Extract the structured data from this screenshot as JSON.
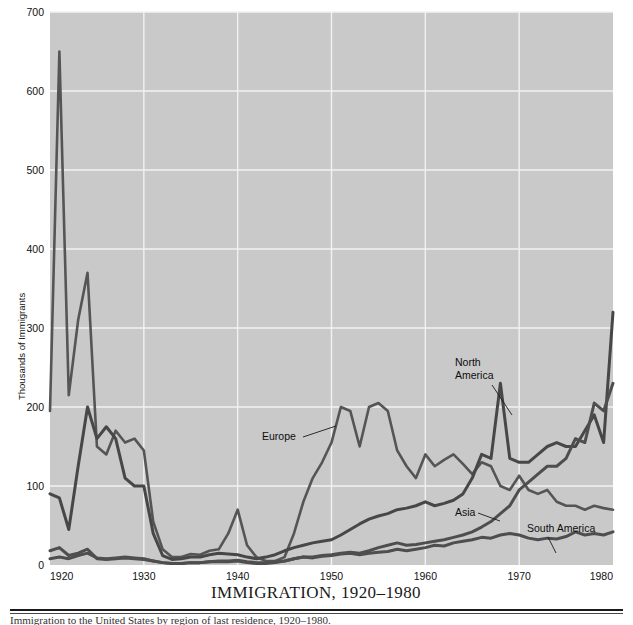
{
  "figure": {
    "caption": "IMMIGRATION, 1920–1980",
    "footnote": "Immigration to the United States by region of last residence, 1920–1980.",
    "width": 633,
    "height": 625
  },
  "plot": {
    "background_color": "#c9c9c9",
    "gridline_color": "#f2f2f2",
    "left": 50,
    "top": 12,
    "right": 613,
    "bottom": 565
  },
  "axes": {
    "y_title": "Thousands of Immigrants",
    "y_ticks": [
      0,
      100,
      200,
      300,
      400,
      500,
      600,
      700
    ],
    "y_tick_labels": [
      "0",
      "100",
      "200",
      "300",
      "400",
      "500",
      "600",
      "700"
    ],
    "y_min": 0,
    "y_max": 700,
    "x_ticks": [
      1920,
      1930,
      1940,
      1950,
      1960,
      1970,
      1980
    ],
    "x_tick_labels": [
      "1920",
      "1930",
      "1940",
      "1950",
      "1960",
      "1970",
      "1980"
    ],
    "x_min": 1920,
    "x_max": 1980
  },
  "annotations": [
    {
      "name": "europe",
      "text": "Europe",
      "text_x": 262,
      "text_y": 440,
      "anchor": "start",
      "leader": "M 303 437 L 336 426"
    },
    {
      "name": "north-america",
      "text_lines": [
        "North",
        "America"
      ],
      "text_x": 455,
      "text_y": 366,
      "anchor": "start",
      "leader": "M 492 385 L 512 415"
    },
    {
      "name": "asia",
      "text": "Asia",
      "text_x": 455,
      "text_y": 516,
      "anchor": "start",
      "leader": "M 478 513 L 500 521"
    },
    {
      "name": "south-america",
      "text": "South America",
      "text_x": 527,
      "text_y": 532,
      "anchor": "start",
      "leader": "M 548 537 L 556 553"
    }
  ],
  "chart_data": {
    "type": "line",
    "title": "IMMIGRATION, 1920–1980",
    "xlabel": "",
    "ylabel": "Thousands of Immigrants",
    "xlim": [
      1920,
      1980
    ],
    "ylim": [
      0,
      700
    ],
    "grid": true,
    "legend_position": "inline-annotations",
    "line_color": "#4a4a4a",
    "x": [
      1920,
      1921,
      1922,
      1923,
      1924,
      1925,
      1926,
      1927,
      1928,
      1929,
      1930,
      1931,
      1932,
      1933,
      1934,
      1935,
      1936,
      1937,
      1938,
      1939,
      1940,
      1941,
      1942,
      1943,
      1944,
      1945,
      1946,
      1947,
      1948,
      1949,
      1950,
      1951,
      1952,
      1953,
      1954,
      1955,
      1956,
      1957,
      1958,
      1959,
      1960,
      1961,
      1962,
      1963,
      1964,
      1965,
      1966,
      1967,
      1968,
      1969,
      1970,
      1971,
      1972,
      1973,
      1974,
      1975,
      1976,
      1977,
      1978,
      1979,
      1980
    ],
    "series": [
      {
        "name": "Europe",
        "values": [
          195,
          650,
          215,
          310,
          370,
          150,
          140,
          170,
          155,
          160,
          145,
          55,
          20,
          10,
          10,
          14,
          13,
          18,
          20,
          40,
          70,
          25,
          10,
          5,
          5,
          10,
          40,
          80,
          110,
          130,
          155,
          200,
          195,
          150,
          200,
          205,
          195,
          145,
          125,
          110,
          140,
          125,
          133,
          140,
          128,
          115,
          130,
          125,
          100,
          95,
          113,
          95,
          90,
          95,
          80,
          75,
          75,
          70,
          75,
          72,
          70
        ]
      },
      {
        "name": "North America",
        "values": [
          90,
          85,
          45,
          125,
          200,
          160,
          175,
          160,
          110,
          100,
          100,
          40,
          12,
          7,
          8,
          10,
          10,
          13,
          15,
          14,
          13,
          10,
          8,
          10,
          13,
          18,
          22,
          25,
          28,
          30,
          32,
          38,
          45,
          52,
          58,
          62,
          65,
          70,
          72,
          75,
          80,
          75,
          78,
          82,
          90,
          110,
          140,
          135,
          230,
          135,
          130,
          130,
          140,
          150,
          155,
          150,
          150,
          170,
          190,
          155,
          320
        ]
      },
      {
        "name": "Asia",
        "values": [
          18,
          22,
          12,
          15,
          20,
          8,
          7,
          8,
          9,
          8,
          7,
          5,
          3,
          2,
          2,
          3,
          3,
          4,
          4,
          4,
          5,
          3,
          2,
          2,
          3,
          5,
          8,
          10,
          10,
          12,
          13,
          15,
          16,
          15,
          18,
          22,
          25,
          28,
          25,
          26,
          28,
          30,
          32,
          35,
          38,
          42,
          48,
          55,
          65,
          75,
          95,
          105,
          115,
          125,
          125,
          135,
          160,
          155,
          205,
          195,
          230
        ]
      },
      {
        "name": "South America",
        "values": [
          8,
          10,
          8,
          12,
          15,
          9,
          8,
          9,
          10,
          9,
          8,
          5,
          3,
          2,
          2,
          3,
          3,
          4,
          5,
          5,
          6,
          4,
          3,
          3,
          4,
          5,
          8,
          10,
          9,
          11,
          12,
          14,
          15,
          13,
          15,
          16,
          17,
          20,
          18,
          20,
          22,
          25,
          24,
          28,
          30,
          32,
          35,
          34,
          38,
          40,
          38,
          34,
          32,
          34,
          33,
          36,
          42,
          38,
          40,
          38,
          42
        ]
      }
    ]
  }
}
